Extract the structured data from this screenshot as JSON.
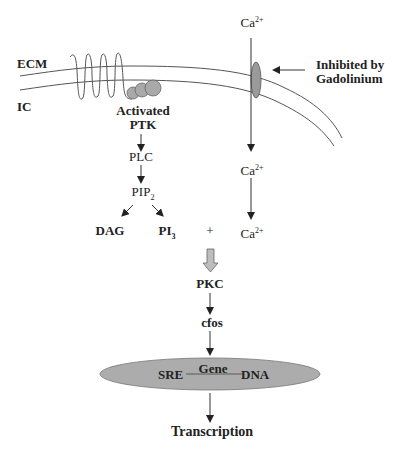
{
  "labels": {
    "ecm": "ECM",
    "ic": "IC",
    "activated": "Activated",
    "ptk": "PTK",
    "plc": "PLC",
    "pip": "PIP",
    "pip_sub": "2",
    "dag": "DAG",
    "pi": "PI",
    "pi_sub": "3",
    "plus": "+",
    "ca_top": "Ca",
    "ca_mid": "Ca",
    "ca_bottom": "Ca",
    "ca_charge": "2+",
    "inhibited_line1": "Inhibited by",
    "inhibited_line2": "Gadolinium",
    "pkc": "PKC",
    "cfos": "cfos",
    "sre": "SRE",
    "gene": "Gene",
    "dna": "DNA",
    "transcription": "Transcription"
  },
  "colors": {
    "line": "#333333",
    "protein_fill": "#a9a9a9",
    "channel_fill": "#9a9a9a",
    "dna_ellipse_fill": "#acacac",
    "block_arrow_fill": "#bdbdbd"
  }
}
